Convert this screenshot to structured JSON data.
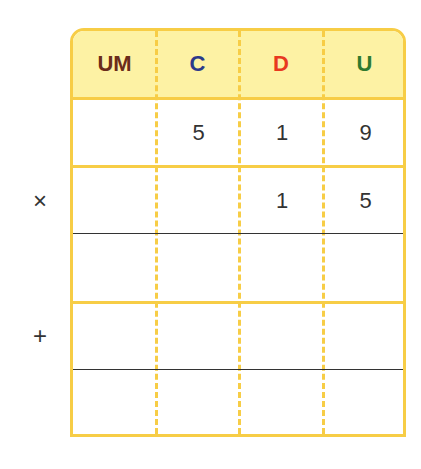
{
  "headers": [
    {
      "label": "UM",
      "color": "#6b2d1a"
    },
    {
      "label": "C",
      "color": "#2b3a8a"
    },
    {
      "label": "D",
      "color": "#e8391f"
    },
    {
      "label": "U",
      "color": "#2f7a2f"
    }
  ],
  "rows": [
    {
      "operator": "",
      "cells": [
        "",
        "5",
        "1",
        "9"
      ]
    },
    {
      "operator": "×",
      "cells": [
        "",
        "",
        "1",
        "5"
      ]
    },
    {
      "operator": "",
      "cells": [
        "",
        "",
        "",
        ""
      ]
    },
    {
      "operator": "+",
      "cells": [
        "",
        "",
        "",
        ""
      ]
    },
    {
      "operator": "",
      "cells": [
        "",
        "",
        "",
        ""
      ]
    }
  ],
  "colors": {
    "grid": "#f7cd46",
    "header_bg": "#fdf2a4",
    "rule": "#333333"
  }
}
